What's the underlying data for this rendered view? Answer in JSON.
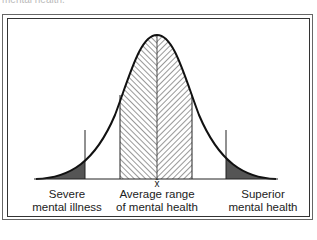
{
  "caption": "mental health.",
  "diagram": {
    "type": "normal-distribution",
    "mean_symbol": "x̄",
    "labels": {
      "left": [
        "Severe",
        "mental illness"
      ],
      "middle": [
        "Average range",
        "of mental health"
      ],
      "right": [
        "Superior",
        "mental health"
      ]
    },
    "regions": [
      {
        "name": "severe-mental-illness",
        "fill": "dark-gray",
        "color": "#555555"
      },
      {
        "name": "average-range",
        "fill": "herringbone-hatch"
      },
      {
        "name": "superior-mental-health",
        "fill": "dark-gray",
        "color": "#555555"
      }
    ]
  }
}
